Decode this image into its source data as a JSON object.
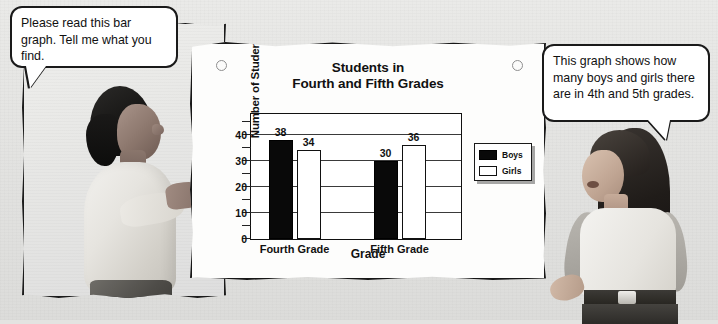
{
  "scene": {
    "left_panel_name": "woman-photo-panel",
    "right_figure_name": "girl-figure"
  },
  "bubbles": {
    "left": {
      "speaker": "woman",
      "text": "Please read this bar graph. Tell me what you find."
    },
    "right": {
      "speaker": "girl",
      "text": "This graph shows how many boys and girls there are in 4th and 5th grades."
    }
  },
  "card": {
    "hole_left": "◦",
    "hole_right": "◦"
  },
  "chart_data": {
    "type": "bar",
    "title": "Students in Fourth and Fifth Grades",
    "title_line1": "Students in",
    "title_line2": "Fourth and Fifth Grades",
    "xlabel": "Grade",
    "ylabel": "Number of Students",
    "categories": [
      "Fourth Grade",
      "Fifth Grade"
    ],
    "series": [
      {
        "name": "Boys",
        "values": [
          38,
          30
        ],
        "color": "#090909"
      },
      {
        "name": "Girls",
        "values": [
          34,
          36
        ],
        "color": "#ffffff"
      }
    ],
    "ylim": [
      0,
      48
    ],
    "yticks": [
      0,
      10,
      20,
      30,
      40
    ],
    "ytick_labels": [
      "0",
      "10",
      "20",
      "30",
      "40"
    ],
    "yminor_ticks": [
      5,
      15,
      25,
      35,
      45
    ],
    "gridlines": [
      10,
      20,
      30,
      40
    ],
    "grid": true,
    "legend_position": "right-outside",
    "legend_entries": [
      "Boys",
      "Girls"
    ],
    "bar_value_labels": [
      38,
      34,
      30,
      36
    ]
  }
}
